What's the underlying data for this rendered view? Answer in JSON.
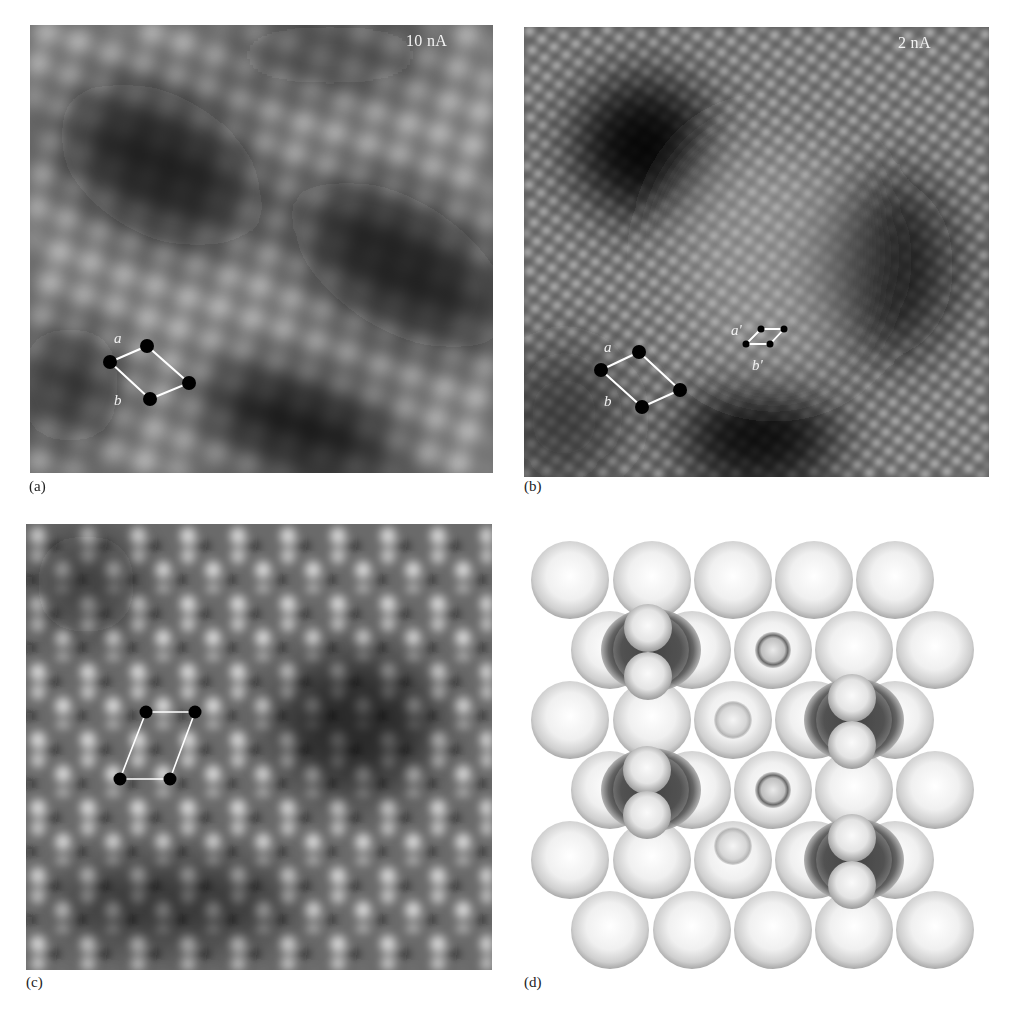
{
  "figure": {
    "panels": [
      {
        "id": "a",
        "label": "(a)",
        "type": "stm-image",
        "annotation": "10 nA",
        "unit_cell": {
          "vector_labels": [
            "a",
            "b"
          ]
        }
      },
      {
        "id": "b",
        "label": "(b)",
        "type": "stm-image",
        "annotation": "2 nA",
        "unit_cell": {
          "vector_labels": [
            "a",
            "b"
          ]
        },
        "small_unit_cell": {
          "vector_labels": [
            "a'",
            "b'"
          ]
        }
      },
      {
        "id": "c",
        "label": "(c)",
        "type": "stm-image",
        "annotation": ""
      },
      {
        "id": "d",
        "label": "(d)",
        "type": "ball-model",
        "rows": 6,
        "atoms_per_row": 5,
        "adsorbates": 4
      }
    ]
  }
}
